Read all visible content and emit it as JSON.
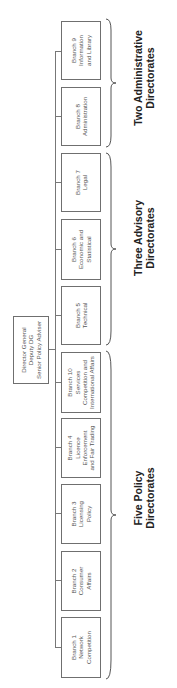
{
  "director": {
    "label": "Director General\nDeputy DG\nSenior Policy Adviser"
  },
  "branches": [
    {
      "id": 1,
      "label": "Branch 1\nNetwork\nCompetition"
    },
    {
      "id": 2,
      "label": "Branch 2\nConsumer\nAffairs"
    },
    {
      "id": 3,
      "label": "Branch 3\nLicensing\nPolicy"
    },
    {
      "id": 4,
      "label": "Branch 4\nLicence\nEnforcement\nand Fair Trading"
    },
    {
      "id": 10,
      "label": "Branch 10\nServices\nCompetition and\nInternational Affairs"
    },
    {
      "id": 5,
      "label": "Branch 5\nTechnical"
    },
    {
      "id": 6,
      "label": "Branch 6\nEconomic and\nStatistical"
    },
    {
      "id": 7,
      "label": "Branch 7\nLegal"
    },
    {
      "id": 8,
      "label": "Branch 8\nAdministration"
    },
    {
      "id": 9,
      "label": "Branch 9\nInformation\nand Library"
    }
  ],
  "groups": [
    {
      "label": "Five Policy\nDirectorates",
      "branches": [
        1,
        2,
        3,
        4,
        10
      ]
    },
    {
      "label": "Three Advisory\nDirectorates",
      "branches": [
        5,
        6,
        7
      ]
    },
    {
      "label": "Two Administrative\nDirectorates",
      "branches": [
        8,
        9
      ]
    }
  ],
  "colors": {
    "box_border": "#6f6f6f",
    "box_text": "#555555",
    "connector": "#777777",
    "group_label": "#222222"
  }
}
